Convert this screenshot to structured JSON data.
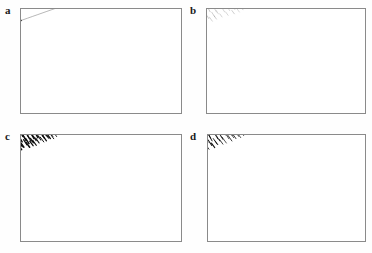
{
  "figure": {
    "type": "multi-panel-scientific-figure",
    "layout": "2x2",
    "width": 372,
    "height": 253,
    "background": "#ffffff",
    "frame_color": "#8a8a8a",
    "ink_color": "#1a1a1a"
  },
  "panels": [
    {
      "id": "a",
      "label": "a",
      "label_x": 5,
      "label_y": 5,
      "frame": {
        "x": 20,
        "y": 8,
        "w": 162,
        "h": 106
      },
      "render": "grid",
      "description": "curvilinear grid of thick contour arcs crossed by thin radial curves with tick marks",
      "contour_color": "#111111",
      "radial_color": "#7d7d7d",
      "contour_width": 1.5,
      "radial_width": 0.55,
      "tick_color": "#111111",
      "tick_width": 0.8,
      "tick_length": 3.2,
      "ticks_on_contour": [
        0,
        2
      ],
      "dash_length": 0,
      "stroke_width": 0,
      "stroke_color": "#000000",
      "density": 0
    },
    {
      "id": "b",
      "label": "b",
      "label_x": 190,
      "label_y": 5,
      "frame": {
        "x": 206,
        "y": 8,
        "w": 160,
        "h": 106
      },
      "render": "strokes",
      "description": "sparse light-gray short dashes aligned with the field direction",
      "contour_color": "#111111",
      "radial_color": "#7d7d7d",
      "contour_width": 0,
      "radial_width": 0,
      "tick_color": "#111111",
      "tick_width": 0,
      "tick_length": 0,
      "ticks_on_contour": [],
      "dash_length": 5.0,
      "stroke_width": 0.55,
      "stroke_color": "#9a9a9a",
      "density": 1.0
    },
    {
      "id": "c",
      "label": "c",
      "label_x": 5,
      "label_y": 131,
      "frame": {
        "x": 20,
        "y": 134,
        "w": 162,
        "h": 108
      },
      "render": "strokes",
      "description": "dense heavy black dashes with tapered weight producing a dark texture",
      "contour_color": "#111111",
      "radial_color": "#7d7d7d",
      "contour_width": 0,
      "radial_width": 0,
      "tick_color": "#111111",
      "tick_width": 0,
      "tick_length": 0,
      "ticks_on_contour": [],
      "dash_length": 6.5,
      "stroke_width": 1.5,
      "stroke_color": "#0d0d0d",
      "density": 1.45
    },
    {
      "id": "d",
      "label": "d",
      "label_x": 190,
      "label_y": 131,
      "frame": {
        "x": 207,
        "y": 134,
        "w": 159,
        "h": 108
      },
      "render": "strokes",
      "description": "medium-weight black dashes, more uniform and slightly sparser than panel c",
      "contour_color": "#111111",
      "radial_color": "#7d7d7d",
      "contour_width": 0,
      "radial_width": 0,
      "tick_color": "#111111",
      "tick_width": 0,
      "tick_length": 0,
      "ticks_on_contour": [],
      "dash_length": 6.0,
      "stroke_width": 1.0,
      "stroke_color": "#111111",
      "density": 1.2
    }
  ],
  "field": {
    "description": "radial fan field; center of curvature lies above-right of the panel, vectors follow concentric arcs",
    "center_u": 0.76,
    "center_v": -0.3,
    "r_min": 0.28,
    "r_max": 1.38,
    "ang_min": 96,
    "ang_max": 212,
    "n_contours": 4,
    "n_radials": 13
  }
}
